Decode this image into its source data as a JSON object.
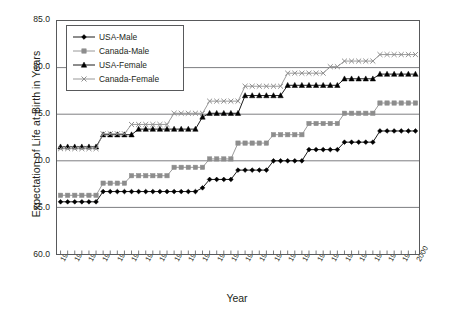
{
  "chart_data": {
    "type": "line",
    "title": "",
    "xlabel": "Year",
    "ylabel": "Expectation of Life at Birth in Years",
    "xlim": [
      1949.5,
      2000.5
    ],
    "ylim": [
      60.0,
      85.0
    ],
    "yticks": [
      "85.0",
      "80.0",
      "75.0",
      "70.0",
      "65.0",
      "60.0"
    ],
    "ytick_values": [
      85.0,
      80.0,
      75.0,
      70.0,
      65.0,
      60.0
    ],
    "grid": "horizontal",
    "legend_position": "top-left-inside",
    "x": [
      1950,
      1951,
      1952,
      1953,
      1954,
      1955,
      1956,
      1957,
      1958,
      1959,
      1960,
      1961,
      1962,
      1963,
      1964,
      1965,
      1966,
      1967,
      1968,
      1969,
      1970,
      1971,
      1972,
      1973,
      1974,
      1975,
      1976,
      1977,
      1978,
      1979,
      1980,
      1981,
      1982,
      1983,
      1984,
      1985,
      1986,
      1987,
      1988,
      1989,
      1990,
      1991,
      1992,
      1993,
      1994,
      1995,
      1996,
      1997,
      1998,
      1999,
      2000
    ],
    "xtick_labels": [
      "1950",
      "1952",
      "1954",
      "1956",
      "1958",
      "1960",
      "1962",
      "1964",
      "1966",
      "1968",
      "1970",
      "1972",
      "1974",
      "1976",
      "1978",
      "1980",
      "1982",
      "1984",
      "1986",
      "1988",
      "1990",
      "1992",
      "1994",
      "1996",
      "1998",
      "2000"
    ],
    "series": [
      {
        "name": "USA-Male",
        "color": "#000000",
        "marker": "diamond",
        "values": [
          65.6,
          65.6,
          65.6,
          65.6,
          65.6,
          65.6,
          66.7,
          66.7,
          66.7,
          66.7,
          66.7,
          66.7,
          66.7,
          66.7,
          66.7,
          66.7,
          66.7,
          66.7,
          66.7,
          66.7,
          67.1,
          68.0,
          68.0,
          68.0,
          68.0,
          69.0,
          69.0,
          69.0,
          69.0,
          69.0,
          70.0,
          70.0,
          70.0,
          70.0,
          70.0,
          71.2,
          71.2,
          71.2,
          71.2,
          71.2,
          72.0,
          72.0,
          72.0,
          72.0,
          72.0,
          73.2,
          73.2,
          73.2,
          73.2,
          73.2,
          73.2
        ]
      },
      {
        "name": "Canada-Male",
        "color": "#8d8d8d",
        "marker": "square",
        "values": [
          66.3,
          66.3,
          66.3,
          66.3,
          66.3,
          66.3,
          67.6,
          67.6,
          67.6,
          67.6,
          68.4,
          68.4,
          68.4,
          68.4,
          68.4,
          68.4,
          69.3,
          69.3,
          69.3,
          69.3,
          69.3,
          70.2,
          70.2,
          70.2,
          70.2,
          71.9,
          71.9,
          71.9,
          71.9,
          71.9,
          72.8,
          72.8,
          72.8,
          72.8,
          72.8,
          74.0,
          74.0,
          74.0,
          74.0,
          74.0,
          75.1,
          75.1,
          75.1,
          75.1,
          75.1,
          76.2,
          76.2,
          76.2,
          76.2,
          76.2,
          76.2
        ]
      },
      {
        "name": "USA-Female",
        "color": "#000000",
        "marker": "triangle",
        "values": [
          71.5,
          71.5,
          71.5,
          71.5,
          71.5,
          71.5,
          72.8,
          72.8,
          72.8,
          72.8,
          72.8,
          73.4,
          73.4,
          73.4,
          73.4,
          73.4,
          73.4,
          73.4,
          73.4,
          73.4,
          74.7,
          75.1,
          75.1,
          75.1,
          75.1,
          75.1,
          77.0,
          77.0,
          77.0,
          77.0,
          77.0,
          77.0,
          78.1,
          78.1,
          78.1,
          78.1,
          78.1,
          78.1,
          78.1,
          78.1,
          78.8,
          78.8,
          78.8,
          78.8,
          78.8,
          79.3,
          79.3,
          79.3,
          79.3,
          79.3,
          79.3
        ]
      },
      {
        "name": "Canada-Female",
        "color": "#8d8d8d",
        "marker": "cross",
        "values": [
          71.3,
          71.3,
          71.3,
          71.3,
          71.3,
          71.3,
          72.9,
          72.9,
          72.9,
          72.9,
          73.9,
          73.9,
          73.9,
          73.9,
          73.9,
          73.9,
          75.1,
          75.1,
          75.1,
          75.1,
          75.1,
          76.4,
          76.4,
          76.4,
          76.4,
          76.4,
          78.0,
          78.0,
          78.0,
          78.0,
          78.0,
          78.0,
          79.4,
          79.4,
          79.4,
          79.4,
          79.4,
          79.4,
          80.1,
          80.1,
          80.7,
          80.7,
          80.7,
          80.7,
          80.7,
          81.4,
          81.4,
          81.4,
          81.4,
          81.4,
          81.4
        ]
      }
    ]
  },
  "axis": {
    "y_title": "Expectation of Life at Birth in Years",
    "x_title": "Year"
  },
  "legend": {
    "items": [
      {
        "label": "USA-Male"
      },
      {
        "label": "Canada-Male"
      },
      {
        "label": "USA-Female"
      },
      {
        "label": "Canada-Female"
      }
    ]
  }
}
